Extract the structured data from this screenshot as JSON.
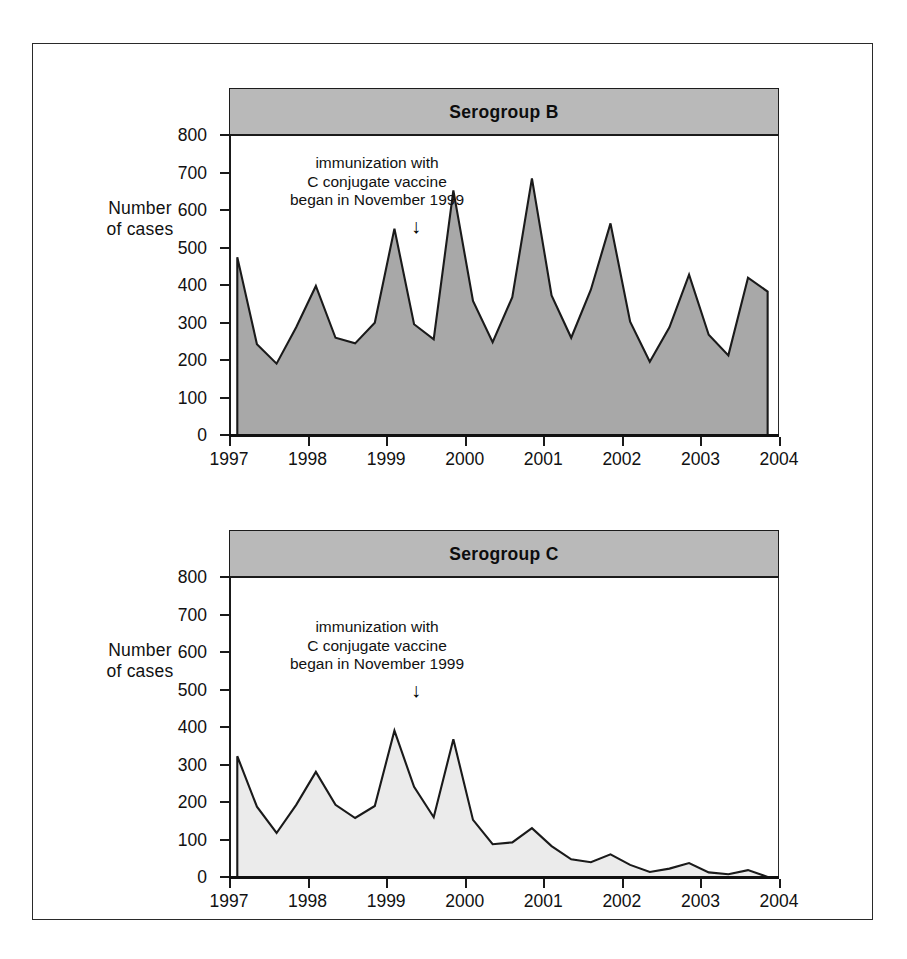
{
  "figure": {
    "background": "#ffffff",
    "frame_color": "#2a2a2a"
  },
  "axis": {
    "y_label_line1": "Number",
    "y_label_line2": "of cases",
    "y_ticks": [
      "800",
      "700",
      "600",
      "500",
      "400",
      "300",
      "200",
      "100",
      "0"
    ],
    "x_ticks": [
      "1997",
      "1998",
      "1999",
      "2000",
      "2001",
      "2002",
      "2003",
      "2004"
    ]
  },
  "annotation": {
    "line1": "immunization with",
    "line2": "C conjugate vaccine",
    "line3": "began in November 1999",
    "arrow": "↓"
  },
  "panels": [
    {
      "title": "Serogroup B",
      "fill": "#a8a8a8",
      "band": "#b9b9b9"
    },
    {
      "title": "Serogroup C",
      "fill": "#ebebeb",
      "band": "#b9b9b9"
    }
  ],
  "chart_data": [
    {
      "type": "area",
      "title": "Serogroup B",
      "xlabel": "",
      "ylabel": "Number of cases",
      "ylim": [
        0,
        800
      ],
      "xlim": [
        1997.0,
        2004.0
      ],
      "grid": false,
      "legend": "none",
      "fill_color": "#a8a8a8",
      "line_color": "#1a1a1a",
      "annotation": "immunization with C conjugate vaccine began in November 1999",
      "annotation_x": 1999.5,
      "x": [
        1997.08,
        1997.33,
        1997.58,
        1997.83,
        1998.08,
        1998.33,
        1998.58,
        1998.83,
        1999.08,
        1999.33,
        1999.58,
        1999.83,
        2000.08,
        2000.33,
        2000.58,
        2000.83,
        2001.08,
        2001.33,
        2001.58,
        2001.83,
        2002.08,
        2002.33,
        2002.58,
        2002.83,
        2003.08,
        2003.33,
        2003.58,
        2003.83
      ],
      "values": [
        477,
        245,
        193,
        290,
        400,
        262,
        247,
        302,
        553,
        298,
        258,
        655,
        360,
        250,
        370,
        687,
        375,
        262,
        390,
        567,
        305,
        198,
        290,
        430,
        270,
        215,
        422,
        385
      ]
    },
    {
      "type": "area",
      "title": "Serogroup C",
      "xlabel": "",
      "ylabel": "Number of cases",
      "ylim": [
        0,
        800
      ],
      "xlim": [
        1997.0,
        2004.0
      ],
      "grid": false,
      "legend": "none",
      "fill_color": "#ebebeb",
      "line_color": "#1a1a1a",
      "annotation": "immunization with C conjugate vaccine began in November 1999",
      "annotation_x": 1999.5,
      "x": [
        1997.08,
        1997.33,
        1997.58,
        1997.83,
        1998.08,
        1998.33,
        1998.58,
        1998.83,
        1999.08,
        1999.33,
        1999.58,
        1999.83,
        2000.08,
        2000.33,
        2000.58,
        2000.83,
        2001.08,
        2001.33,
        2001.58,
        2001.83,
        2002.08,
        2002.33,
        2002.58,
        2002.83,
        2003.08,
        2003.33,
        2003.58,
        2003.83
      ],
      "values": [
        325,
        190,
        120,
        195,
        283,
        195,
        160,
        192,
        393,
        243,
        162,
        370,
        155,
        90,
        95,
        133,
        85,
        50,
        42,
        63,
        35,
        16,
        25,
        40,
        15,
        10,
        21,
        3
      ]
    }
  ]
}
